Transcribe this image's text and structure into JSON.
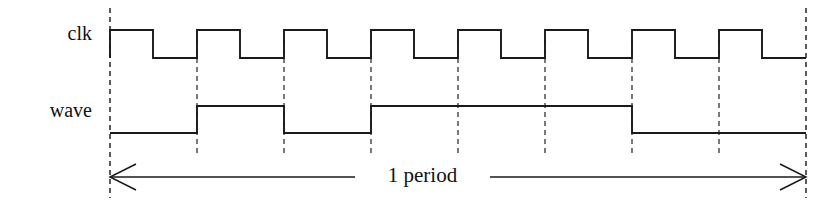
{
  "figure": {
    "background_color": "#ffffff",
    "stroke_color": "#1a1a1a",
    "grid_color": "#333333"
  },
  "labels": {
    "clk": "clk",
    "wave": "wave",
    "period": "1 period"
  },
  "chart_data": {
    "type": "line",
    "title": "",
    "xlabel": "",
    "ylabel": "",
    "grid": true,
    "legend_position": "left",
    "axis": {
      "x_start_px": 110,
      "x_end_px": 806,
      "clock_period_px": 87,
      "clock_cycles": 8
    },
    "gridlines_px": [
      110,
      197,
      284,
      371,
      458,
      545,
      632,
      719,
      806
    ],
    "signals": [
      {
        "name": "clk",
        "label": "clk",
        "high_y_px": 30,
        "low_y_px": 58,
        "initial_level": "low",
        "edges_px": [
          {
            "x": 110,
            "to": "high"
          },
          {
            "x": 153,
            "to": "low"
          },
          {
            "x": 197,
            "to": "high"
          },
          {
            "x": 240,
            "to": "low"
          },
          {
            "x": 284,
            "to": "high"
          },
          {
            "x": 327,
            "to": "low"
          },
          {
            "x": 371,
            "to": "high"
          },
          {
            "x": 414,
            "to": "low"
          },
          {
            "x": 458,
            "to": "high"
          },
          {
            "x": 501,
            "to": "low"
          },
          {
            "x": 545,
            "to": "high"
          },
          {
            "x": 588,
            "to": "low"
          },
          {
            "x": 632,
            "to": "high"
          },
          {
            "x": 675,
            "to": "low"
          },
          {
            "x": 719,
            "to": "high"
          },
          {
            "x": 762,
            "to": "low"
          }
        ]
      },
      {
        "name": "wave",
        "label": "wave",
        "high_y_px": 106,
        "low_y_px": 133,
        "initial_level": "low",
        "edges_px": [
          {
            "x": 197,
            "to": "high"
          },
          {
            "x": 284,
            "to": "low"
          },
          {
            "x": 371,
            "to": "high"
          },
          {
            "x": 632,
            "to": "low"
          }
        ]
      }
    ],
    "annotation": {
      "text": "1 period",
      "kind": "double-headed-arrow",
      "y_px": 177,
      "from_px": 110,
      "to_px": 806
    }
  }
}
